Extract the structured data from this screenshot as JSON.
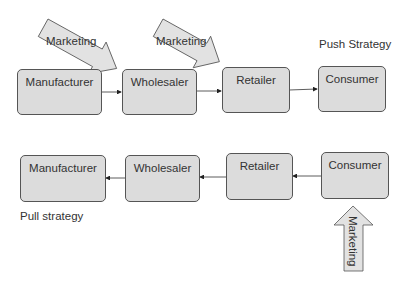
{
  "diagram": {
    "push": {
      "title": "Push Strategy",
      "nodes": [
        "Manufacturer",
        "Wholesaler",
        "Retailer",
        "Consumer"
      ],
      "flow_direction": "left-to-right",
      "marketing_arrows": [
        {
          "label": "Marketing",
          "target": "Manufacturer→Wholesaler"
        },
        {
          "label": "Marketing",
          "target": "Wholesaler→Retailer"
        }
      ]
    },
    "pull": {
      "title": "Pull strategy",
      "nodes": [
        "Manufacturer",
        "Wholesaler",
        "Retailer",
        "Consumer"
      ],
      "flow_direction": "right-to-left",
      "marketing_arrows": [
        {
          "label": "Marketing",
          "target": "Consumer"
        }
      ]
    },
    "colors": {
      "box_fill": "#dcdcdc",
      "box_border": "#555555",
      "arrow_fill": "#e2e2e2",
      "line": "#333333"
    }
  }
}
